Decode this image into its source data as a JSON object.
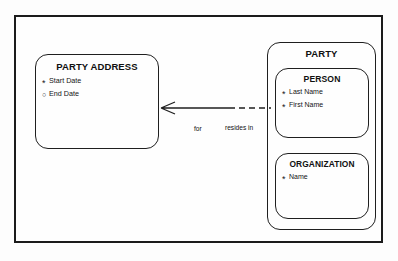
{
  "diagram": {
    "type": "entity-relationship-diagram",
    "entities": [
      {
        "id": "party-address",
        "name": "PARTY ADDRESS",
        "attributes": [
          {
            "marker": "mandatory",
            "marker_glyph": "*",
            "label": "Start Date"
          },
          {
            "marker": "optional",
            "marker_glyph": "○",
            "label": "End Date"
          }
        ]
      },
      {
        "id": "party",
        "name": "PARTY",
        "attributes": [],
        "subtypes": [
          {
            "id": "person",
            "name": "PERSON",
            "attributes": [
              {
                "marker": "mandatory",
                "marker_glyph": "*",
                "label": "Last Name"
              },
              {
                "marker": "mandatory",
                "marker_glyph": "*",
                "label": "First Name"
              }
            ]
          },
          {
            "id": "organization",
            "name": "ORGANIZATION",
            "attributes": [
              {
                "marker": "mandatory",
                "marker_glyph": "*",
                "label": "Name"
              }
            ]
          }
        ]
      }
    ],
    "relationship": {
      "from_label": "for",
      "to_label": "resides in",
      "from_cardinality": "many",
      "from_optionality": "mandatory",
      "to_cardinality": "one",
      "to_optionality": "optional"
    },
    "colors": {
      "line": "#1f1f1f",
      "frame": "#1b1b1b",
      "text": "#101010",
      "background": "#fdfdfd"
    }
  }
}
